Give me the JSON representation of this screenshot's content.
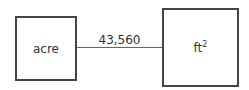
{
  "diagram": {
    "left_box": {
      "label": "acre"
    },
    "right_box": {
      "label": "ft",
      "superscript": "2"
    },
    "edge": {
      "label": "43,560"
    }
  }
}
